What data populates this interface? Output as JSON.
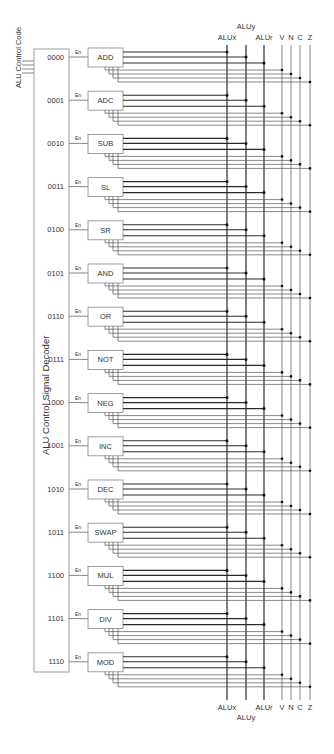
{
  "diagram": {
    "title_left": "ALU Control Code",
    "decoder_label": "ALU Control Signal Decoder",
    "enable_label": "En",
    "units": [
      {
        "code": "0000",
        "name": "ADD"
      },
      {
        "code": "0001",
        "name": "ADC"
      },
      {
        "code": "0010",
        "name": "SUB"
      },
      {
        "code": "0011",
        "name": "SL"
      },
      {
        "code": "0100",
        "name": "SR"
      },
      {
        "code": "0101",
        "name": "AND"
      },
      {
        "code": "0110",
        "name": "OR"
      },
      {
        "code": "0111",
        "name": "NOT"
      },
      {
        "code": "1000",
        "name": "NEG"
      },
      {
        "code": "1001",
        "name": "INC"
      },
      {
        "code": "1010",
        "name": "DEC"
      },
      {
        "code": "1011",
        "name": "SWAP"
      },
      {
        "code": "1100",
        "name": "MUL"
      },
      {
        "code": "1101",
        "name": "DIV"
      },
      {
        "code": "1110",
        "name": "MOD"
      }
    ],
    "buses": [
      {
        "name": "ALUx",
        "x": 227,
        "kind": "data"
      },
      {
        "name": "ALUy",
        "x": 246,
        "kind": "data"
      },
      {
        "name": "ALUr",
        "x": 264,
        "kind": "data"
      },
      {
        "name": "V",
        "x": 282,
        "kind": "flag"
      },
      {
        "name": "N",
        "x": 291,
        "kind": "flag"
      },
      {
        "name": "C",
        "x": 300,
        "kind": "flag"
      },
      {
        "name": "Z",
        "x": 310,
        "kind": "flag"
      }
    ],
    "colors": {
      "line": "#333333",
      "thick_line": "#2a2a2a",
      "thin_line": "#555555",
      "box_stroke": "#888888",
      "text": "#333333"
    }
  }
}
